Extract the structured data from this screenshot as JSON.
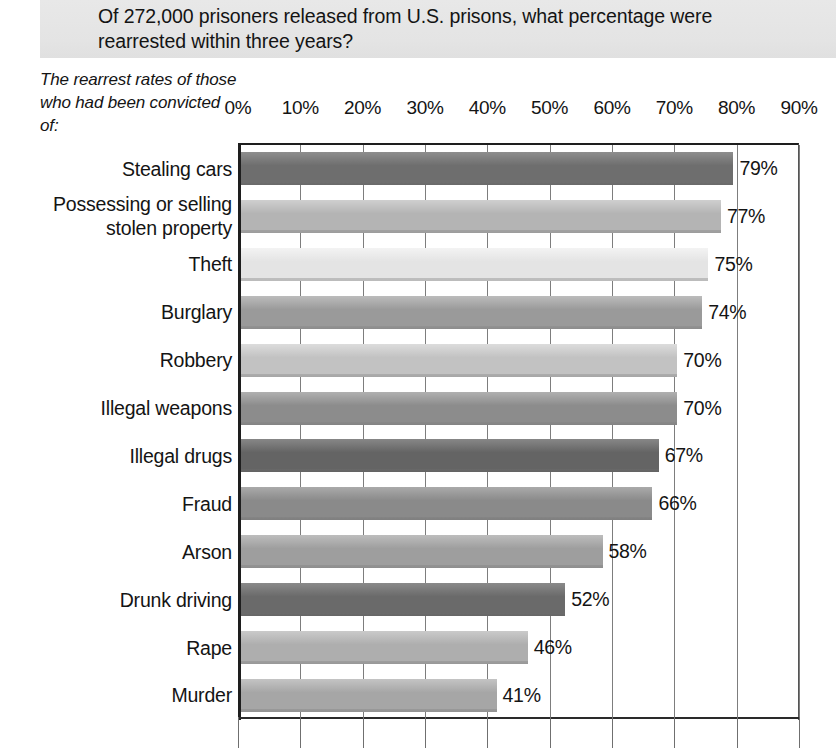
{
  "header": {
    "question": "Of 272,000 prisoners released from U.S. prisons, what percentage were rearrested within three years?",
    "banner_color": "#e6e6e6"
  },
  "axis_caption": "The rearrest rates\nof those who had\nbeen convicted of:",
  "chart_data": {
    "type": "bar",
    "orientation": "horizontal",
    "title": "Of 272,000 prisoners released from U.S. prisons, what percentage were rearrested within three years?",
    "xlabel": "",
    "ylabel": "The rearrest rates of those who had been convicted of:",
    "xlim": [
      0,
      90
    ],
    "xtick_labels": [
      "0%",
      "10%",
      "20%",
      "30%",
      "40%",
      "50%",
      "60%",
      "70%",
      "80%",
      "90%"
    ],
    "xticks": [
      0,
      10,
      20,
      30,
      40,
      50,
      60,
      70,
      80,
      90
    ],
    "grid": true,
    "legend": "none",
    "categories": [
      "Stealing cars",
      "Possessing or selling\nstolen property",
      "Theft",
      "Burglary",
      "Robbery",
      "Illegal weapons",
      "Illegal drugs",
      "Fraud",
      "Arson",
      "Drunk driving",
      "Rape",
      "Murder"
    ],
    "values": [
      79,
      77,
      75,
      74,
      70,
      70,
      67,
      66,
      58,
      52,
      46,
      41
    ],
    "value_labels": [
      "79%",
      "77%",
      "75%",
      "74%",
      "70%",
      "70%",
      "67%",
      "66%",
      "58%",
      "52%",
      "46%",
      "41%"
    ],
    "bar_colors": [
      "#6e6e6e",
      "#b4b4b4",
      "#e4e4e4",
      "#9a9a9a",
      "#c2c2c2",
      "#8c8c8c",
      "#646464",
      "#8a8a8a",
      "#9e9e9e",
      "#6a6a6a",
      "#aeaeae",
      "#a6a6a6"
    ],
    "bar_colors_light": [
      "#8e8e8e",
      "#cfcfcf",
      "#f3f3f3",
      "#bcbcbc",
      "#dcdcdc",
      "#b0b0b0",
      "#878787",
      "#aaaaaa",
      "#bdbdbd",
      "#8a8a8a",
      "#cacaca",
      "#c4c4c4"
    ]
  }
}
